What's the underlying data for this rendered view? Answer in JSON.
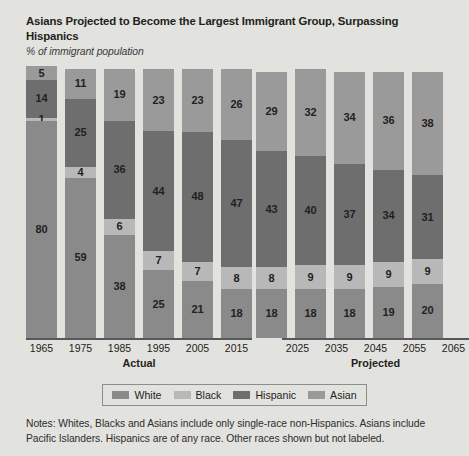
{
  "title": "Asians Projected to Become the Largest Immigrant Group, Surpassing Hispanics",
  "subtitle": "% of immigrant population",
  "groups": {
    "actual_label": "Actual",
    "projected_label": "Projected"
  },
  "legend": {
    "items": [
      {
        "label": "White",
        "color": "#8a8a8a"
      },
      {
        "label": "Black",
        "color": "#b8b8b8"
      },
      {
        "label": "Hispanic",
        "color": "#6e6e6e"
      },
      {
        "label": "Asian",
        "color": "#9a9a9a"
      }
    ]
  },
  "notes": "Notes: Whites, Blacks and Asians include only single-race non-Hispanics. Asians include Pacific Islanders. Hispanics are of any race. Other races shown but not labeled.",
  "chart_data": {
    "type": "bar",
    "stacked": true,
    "title": "Asians Projected to Become the Largest Immigrant Group, Surpassing Hispanics",
    "subtitle": "% of immigrant population",
    "xlabel": "",
    "ylabel": "% of immigrant population",
    "ylim": [
      0,
      100
    ],
    "grid": false,
    "legend_position": "bottom",
    "categories": [
      "1965",
      "1975",
      "1985",
      "1995",
      "2005",
      "2015",
      "2025",
      "2035",
      "2045",
      "2055",
      "2065"
    ],
    "category_groups": [
      {
        "name": "Actual",
        "categories": [
          "1965",
          "1975",
          "1985",
          "1995",
          "2005",
          "2015"
        ]
      },
      {
        "name": "Projected",
        "categories": [
          "2025",
          "2035",
          "2045",
          "2055",
          "2065"
        ]
      }
    ],
    "series": [
      {
        "name": "White",
        "color": "#8a8a8a",
        "values": [
          80,
          59,
          38,
          25,
          21,
          18,
          18,
          18,
          18,
          19,
          20
        ]
      },
      {
        "name": "Black",
        "color": "#b8b8b8",
        "values": [
          1,
          4,
          6,
          7,
          7,
          8,
          8,
          9,
          9,
          9,
          9
        ]
      },
      {
        "name": "Hispanic",
        "color": "#6e6e6e",
        "values": [
          14,
          25,
          36,
          44,
          48,
          47,
          43,
          40,
          37,
          34,
          31
        ]
      },
      {
        "name": "Asian",
        "color": "#9a9a9a",
        "values": [
          5,
          11,
          19,
          23,
          23,
          26,
          29,
          32,
          34,
          36,
          38
        ]
      }
    ],
    "stack_order_bottom_to_top": [
      "White",
      "Black",
      "Hispanic",
      "Asian"
    ],
    "bars": [
      {
        "year": "1965",
        "group": "Actual",
        "White": 80,
        "Black": 1,
        "Hispanic": 14,
        "Asian": 5
      },
      {
        "year": "1975",
        "group": "Actual",
        "White": 59,
        "Black": 4,
        "Hispanic": 25,
        "Asian": 11
      },
      {
        "year": "1985",
        "group": "Actual",
        "White": 38,
        "Black": 6,
        "Hispanic": 36,
        "Asian": 19
      },
      {
        "year": "1995",
        "group": "Actual",
        "White": 25,
        "Black": 7,
        "Hispanic": 44,
        "Asian": 23
      },
      {
        "year": "2005",
        "group": "Actual",
        "White": 21,
        "Black": 7,
        "Hispanic": 48,
        "Asian": 23
      },
      {
        "year": "2015",
        "group": "Actual",
        "White": 18,
        "Black": 8,
        "Hispanic": 47,
        "Asian": 26
      },
      {
        "year": "2025",
        "group": "Projected",
        "White": 18,
        "Black": 8,
        "Hispanic": 43,
        "Asian": 29
      },
      {
        "year": "2035",
        "group": "Projected",
        "White": 18,
        "Black": 9,
        "Hispanic": 40,
        "Asian": 32
      },
      {
        "year": "2045",
        "group": "Projected",
        "White": 18,
        "Black": 9,
        "Hispanic": 37,
        "Asian": 34
      },
      {
        "year": "2055",
        "group": "Projected",
        "White": 19,
        "Black": 9,
        "Hispanic": 34,
        "Asian": 36
      },
      {
        "year": "2065",
        "group": "Projected",
        "White": 20,
        "Black": 9,
        "Hispanic": 31,
        "Asian": 38
      }
    ],
    "annotations": "Bars total less than 100%; other races shown but not labeled."
  }
}
